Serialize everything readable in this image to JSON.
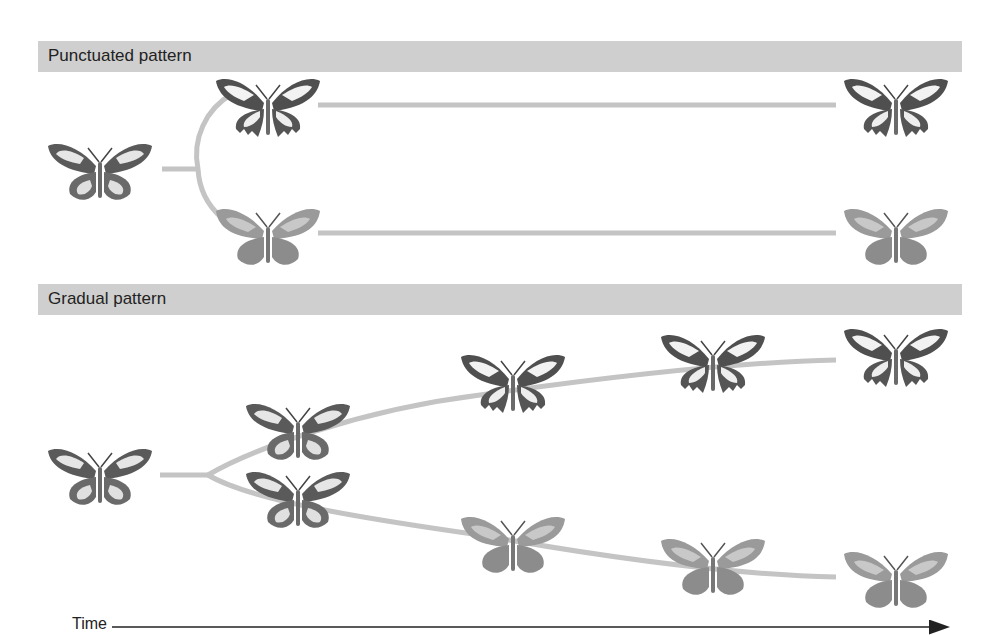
{
  "panels": [
    {
      "title": "Punctuated pattern",
      "type": "punctuated",
      "description": "Ancestor splits rapidly into two distinct forms, which then persist unchanged over time",
      "butterflies": [
        {
          "id": "p-ancestor",
          "form": "intermediate",
          "x": 100,
          "y": 170
        },
        {
          "id": "p-upper-early",
          "form": "dark",
          "x": 268,
          "y": 107
        },
        {
          "id": "p-lower-early",
          "form": "light",
          "x": 268,
          "y": 235
        },
        {
          "id": "p-upper-late",
          "form": "dark",
          "x": 896,
          "y": 107
        },
        {
          "id": "p-lower-late",
          "form": "light",
          "x": 896,
          "y": 235
        }
      ]
    },
    {
      "title": "Gradual pattern",
      "type": "gradual",
      "description": "Ancestor splits into two lineages that diverge slowly and continuously over time",
      "butterflies": [
        {
          "id": "g-ancestor",
          "form": "intermediate",
          "x": 100,
          "y": 475
        },
        {
          "id": "g-upper-1",
          "form": "intermediate",
          "x": 298,
          "y": 430
        },
        {
          "id": "g-lower-1",
          "form": "intermediate",
          "x": 298,
          "y": 498
        },
        {
          "id": "g-upper-2",
          "form": "dark-mid",
          "x": 513,
          "y": 383
        },
        {
          "id": "g-lower-2",
          "form": "light-mid",
          "x": 513,
          "y": 543
        },
        {
          "id": "g-upper-3",
          "form": "dark",
          "x": 713,
          "y": 363
        },
        {
          "id": "g-lower-3",
          "form": "light",
          "x": 713,
          "y": 565
        },
        {
          "id": "g-upper-4",
          "form": "dark",
          "x": 896,
          "y": 357
        },
        {
          "id": "g-lower-4",
          "form": "light",
          "x": 896,
          "y": 578
        }
      ]
    }
  ],
  "axis": {
    "label": "Time",
    "direction": "left-to-right"
  },
  "colors": {
    "header_bar": "#cfcfcf",
    "lineage_line": "#c4c4c4",
    "arrow": "#222222",
    "wing_dark": "#4f4f4f",
    "wing_white": "#f2f2f2",
    "wing_light": "#9a9a9a"
  }
}
